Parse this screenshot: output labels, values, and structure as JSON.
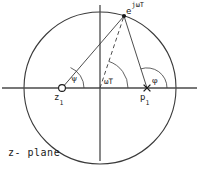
{
  "figure": {
    "caption": "z- plane",
    "plane_label": "z- plane"
  },
  "labels": {
    "unit_circle_point": {
      "base": "e",
      "exponent": "jωT",
      "full": "e^{jωT}"
    },
    "zero": {
      "symbol": "z",
      "subscript": "1",
      "full": "z1"
    },
    "pole": {
      "symbol": "p",
      "subscript": "1",
      "full": "p1"
    },
    "angle_psi": "ψ",
    "angle_omega_t": "ωT",
    "angle_phi": "φ"
  },
  "geometry": {
    "circle": {
      "center_x": 100,
      "center_y": 88,
      "radius": 76
    },
    "real_axis": {
      "x1": 2,
      "y1": 88,
      "x2": 197,
      "y2": 88
    },
    "imag_axis": {
      "x1": 100,
      "y1": 5,
      "x2": 100,
      "y2": 161
    },
    "point_on_circle": {
      "x": 124,
      "y": 16
    },
    "zero_marker": {
      "x": 62,
      "y": 88,
      "type": "circle"
    },
    "pole_marker": {
      "x": 147,
      "y": 88,
      "type": "cross"
    },
    "arc_psi_radius": 22,
    "arc_omega_radius": 28,
    "arc_phi_radius": 20
  },
  "colors": {
    "stroke": "#3a3a3a",
    "axis": "#4a4a4a",
    "text": "#1a1a1a",
    "background": "#ffffff"
  }
}
